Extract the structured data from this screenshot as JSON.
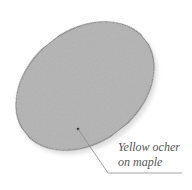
{
  "diagram": {
    "swatch": {
      "shape": "ellipse",
      "fill": "#b9b9b9",
      "stroke": "#7a7a7a",
      "cx": 85,
      "cy": 86,
      "rx": 76,
      "ry": 56,
      "rotation": -38
    },
    "callout": {
      "line1": "Yellow ocher",
      "line2": "on maple",
      "color": "#555555"
    }
  }
}
